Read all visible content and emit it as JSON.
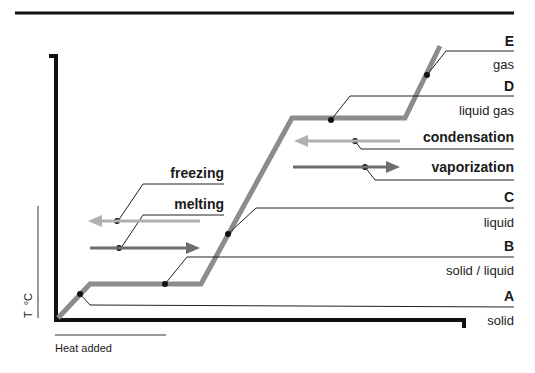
{
  "diagram": {
    "type": "heating-curve",
    "axes": {
      "y_label": "T  °C",
      "x_label": "Heat added"
    },
    "points": [
      {
        "letter": "A",
        "phase": "solid"
      },
      {
        "letter": "B",
        "phase": "solid / liquid"
      },
      {
        "letter": "C",
        "phase": "liquid"
      },
      {
        "letter": "D",
        "phase": "liquid gas"
      },
      {
        "letter": "E",
        "phase": "gas"
      }
    ],
    "processes": [
      {
        "label": "freezing",
        "direction": "left",
        "color": "#b0b0b0"
      },
      {
        "label": "melting",
        "direction": "right",
        "color": "#6e6e6e"
      },
      {
        "label": "condensation",
        "direction": "left",
        "color": "#b0b0b0"
      },
      {
        "label": "vaporization",
        "direction": "right",
        "color": "#6e6e6e"
      }
    ],
    "colors": {
      "curve": "#8c8c8c",
      "axis": "#111111",
      "leader": "#222222",
      "arrow_light": "#b0b0b0",
      "arrow_dark": "#6e6e6e"
    }
  }
}
